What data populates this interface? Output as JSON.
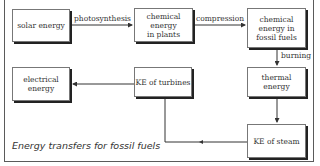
{
  "diagram": {
    "type": "flowchart",
    "caption": "Energy transfers for fossil fuels",
    "nodes": {
      "solar": "solar energy",
      "plants": "chemical energy in plants",
      "fossil": "chemical energy in fossil fuels",
      "thermal": "thermal energy",
      "steam": "KE of steam",
      "turbines": "KE of turbines",
      "electrical": "electrical energy"
    },
    "node_lines": {
      "plants": [
        "chemical",
        "energy",
        "in plants"
      ],
      "fossil": [
        "chemical",
        "energy in",
        "fossil fuels"
      ],
      "electrical": [
        "electrical",
        "energy"
      ]
    },
    "edges": [
      {
        "from": "solar energy",
        "to": "chemical energy in plants",
        "label": "photosynthesis"
      },
      {
        "from": "chemical energy in plants",
        "to": "chemical energy in fossil fuels",
        "label": "compression"
      },
      {
        "from": "chemical energy in fossil fuels",
        "to": "thermal energy",
        "label": "burning"
      },
      {
        "from": "thermal energy",
        "to": "KE of steam",
        "label": ""
      },
      {
        "from": "KE of steam",
        "to": "KE of turbines",
        "label": ""
      },
      {
        "from": "KE of turbines",
        "to": "electrical energy",
        "label": ""
      }
    ],
    "edge_labels": {
      "photosynthesis": "photosynthesis",
      "compression": "compression",
      "burning": "burning"
    },
    "colors": {
      "line": "#333333",
      "box_border": "#777777",
      "box_shadow": "#222222",
      "background": "#ffffff"
    }
  }
}
